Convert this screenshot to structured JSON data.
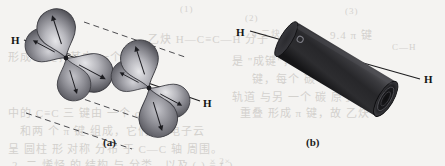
{
  "figure": {
    "background_color": "#f4f3f1",
    "panels": [
      {
        "id": "a",
        "caption": "(a)",
        "description": "Two carbon atoms each with two perpendicular p orbitals overlapping side-by-side to form two pi bonds",
        "atoms": [
          {
            "symbol": "H",
            "position": "left"
          },
          {
            "symbol": "H",
            "position": "right"
          }
        ],
        "orbital_lobe_count": 8,
        "overlap_guide_line_count": 4
      },
      {
        "id": "b",
        "caption": "(b)",
        "description": "Resulting cylindrical pi electron cloud around the carbon-carbon axis",
        "atoms": [
          {
            "symbol": "H",
            "position": "left"
          },
          {
            "symbol": "H",
            "position": "right"
          }
        ],
        "cylinder_color": "#2b2b2d"
      }
    ],
    "colors": {
      "lobe_dark": "#55555a",
      "lobe_mid": "#8a8a90",
      "lobe_light": "#d8d8dc",
      "axis_line": "#1d1d1f",
      "cylinder_body": "#2f2f31",
      "cylinder_end": "#171718",
      "label_text": "#131313",
      "paper": "#f4f3f1",
      "bleed_text": "#b9b6b1"
    }
  },
  "bleed_text": {
    "lines": [
      {
        "text": "(1)",
        "x": 180,
        "y": 4
      },
      {
        "text": "(2)",
        "x": 245,
        "y": 13
      },
      {
        "text": "(3)",
        "x": 345,
        "y": 6
      },
      {
        "text": "4 二炔",
        "x": 252,
        "y": 27
      },
      {
        "text": "乙炔 H—C≡C—H 分子",
        "x": 148,
        "y": 30
      },
      {
        "text": "形成 π 键，其中 一个 π 键由",
        "x": 8,
        "y": 48
      },
      {
        "text": "是 \"成键\"，另一 个是",
        "x": 232,
        "y": 52
      },
      {
        "text": "键，每个 碳 原子",
        "x": 252,
        "y": 70
      },
      {
        "text": "轨道 与另 一个 碳 原子的",
        "x": 232,
        "y": 88
      },
      {
        "text": "重叠 形成 π 键，故 乙炔",
        "x": 240,
        "y": 104
      },
      {
        "text": "中的 C≡C 三 键由 一个 σ 键",
        "x": 8,
        "y": 104
      },
      {
        "text": "和两 个 π 键 组成，它们 的 电子云",
        "x": 20,
        "y": 122
      },
      {
        "text": "呈 圆柱 形 对称 分布 于 C—C 轴 周围。",
        "x": 8,
        "y": 140
      },
      {
        "text": "2. 二 烯烃 的 结构 与 分类，以及 ( ) ≡ ( )",
        "x": 12,
        "y": 156
      },
      {
        "text": "× 2×",
        "x": 210,
        "y": 156
      },
      {
        "text": "9.4 π 键",
        "x": 330,
        "y": 26
      },
      {
        "text": "C—H",
        "x": 392,
        "y": 42
      }
    ]
  },
  "panel_a": {
    "caption": "(a)",
    "caption_x": 103,
    "caption_y": 136,
    "h_left": {
      "text": "H",
      "x": 11,
      "y": 34
    },
    "h_right": {
      "text": "H",
      "x": 203,
      "y": 97
    }
  },
  "panel_b": {
    "caption": "(b)",
    "caption_x": 306,
    "caption_y": 136,
    "h_left": {
      "text": "H",
      "x": 236,
      "y": 26
    },
    "h_right": {
      "text": "H",
      "x": 424,
      "y": 73
    }
  }
}
